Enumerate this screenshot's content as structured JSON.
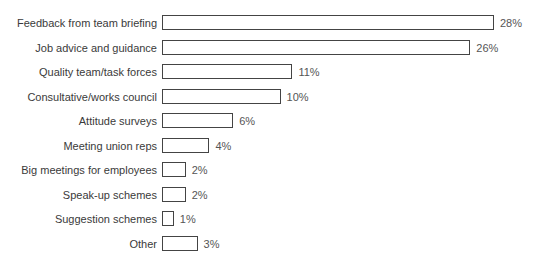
{
  "chart_data": {
    "type": "bar",
    "orientation": "horizontal",
    "title": "",
    "xlabel": "",
    "ylabel": "",
    "categories": [
      "Feedback from team briefing",
      "Job advice and guidance",
      "Quality team/task forces",
      "Consultative/works council",
      "Attitude surveys",
      "Meeting union reps",
      "Big meetings for employees",
      "Speak-up schemes",
      "Suggestion schemes",
      "Other"
    ],
    "values": [
      28,
      26,
      11,
      10,
      6,
      4,
      2,
      2,
      1,
      3
    ],
    "value_labels": [
      "28%",
      "26%",
      "11%",
      "10%",
      "6%",
      "4%",
      "2%",
      "2%",
      "1%",
      "3%"
    ],
    "unit": "%",
    "grid": false,
    "legend": null,
    "xlim": [
      0,
      28
    ]
  }
}
